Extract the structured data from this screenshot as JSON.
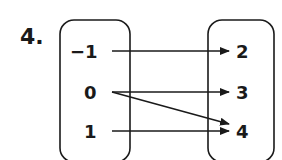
{
  "problem_number": "4.",
  "domain": {
    "values": [
      "−1",
      "0",
      "1"
    ]
  },
  "range": {
    "values": [
      "2",
      "3",
      "4"
    ]
  },
  "mapping": [
    {
      "from": "−1",
      "to": "2"
    },
    {
      "from": "0",
      "to": "3"
    },
    {
      "from": "0",
      "to": "4"
    },
    {
      "from": "1",
      "to": "4"
    }
  ],
  "colors": {
    "stroke": "#1a1a1a",
    "background": "#ffffff"
  }
}
